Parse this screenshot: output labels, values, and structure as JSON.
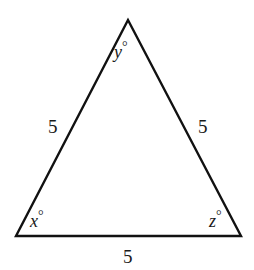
{
  "diagram": {
    "type": "equilateral-triangle",
    "colors": {
      "stroke": "#111111",
      "text": "#1a1a1a",
      "background": "#ffffff"
    },
    "vertices": {
      "top": {
        "x": 128,
        "y": 20
      },
      "bottom_left": {
        "x": 16,
        "y": 236
      },
      "bottom_right": {
        "x": 241,
        "y": 236
      }
    },
    "angles": {
      "top": {
        "variable": "y",
        "unit": "°"
      },
      "bottom_left": {
        "variable": "x",
        "unit": "°"
      },
      "bottom_right": {
        "variable": "z",
        "unit": "°"
      }
    },
    "sides": {
      "left": "5",
      "right": "5",
      "bottom": "5"
    }
  }
}
